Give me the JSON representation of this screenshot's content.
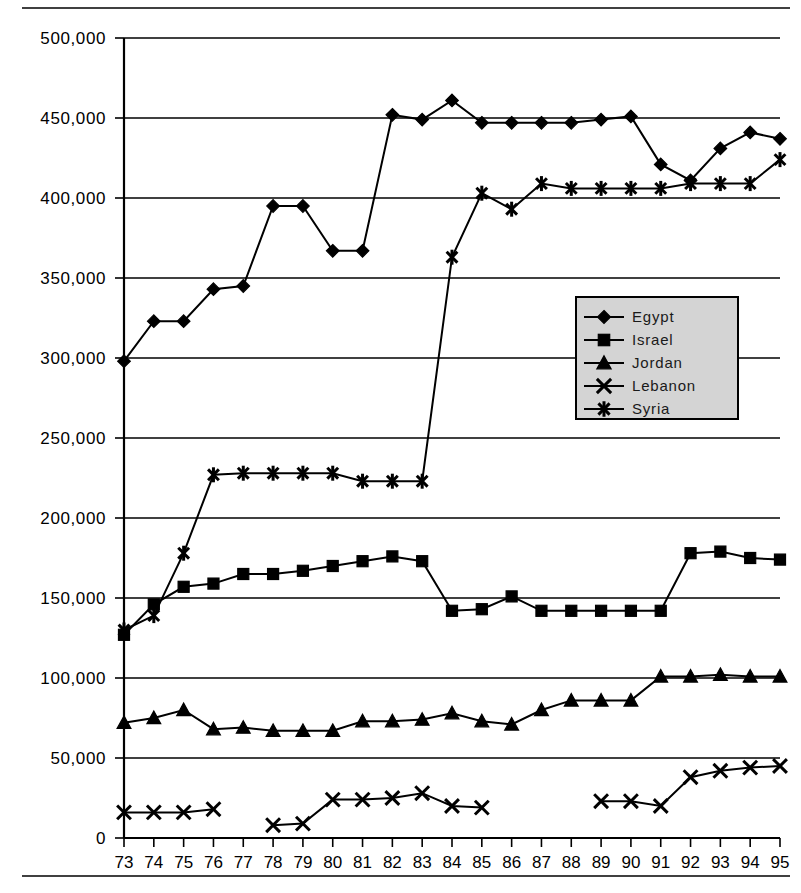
{
  "chart_data": {
    "type": "line",
    "title": "",
    "subtitle": "",
    "xlabel": "",
    "ylabel": "",
    "grid": "horizontal",
    "legend_position": "inside-right-upper",
    "xlim": [
      73,
      95
    ],
    "ylim": [
      0,
      500000
    ],
    "ytick_values": [
      0,
      50000,
      100000,
      150000,
      200000,
      250000,
      300000,
      350000,
      400000,
      450000,
      500000
    ],
    "ytick_labels": [
      "0",
      "50,000",
      "100,000",
      "150,000",
      "200,000",
      "250,000",
      "300,000",
      "350,000",
      "400,000",
      "450,000",
      "500,000"
    ],
    "categories": [
      "73",
      "74",
      "75",
      "76",
      "77",
      "78",
      "79",
      "80",
      "81",
      "82",
      "83",
      "84",
      "85",
      "86",
      "87",
      "88",
      "89",
      "90",
      "91",
      "92",
      "93",
      "94",
      "95"
    ],
    "series": [
      {
        "name": "Egypt",
        "marker": "diamond",
        "values": [
          298000,
          323000,
          323000,
          343000,
          345000,
          395000,
          395000,
          367000,
          367000,
          452000,
          449000,
          461000,
          447000,
          447000,
          447000,
          447000,
          449000,
          451000,
          421000,
          411000,
          431000,
          441000,
          437000
        ]
      },
      {
        "name": "Israel",
        "marker": "square",
        "values": [
          127000,
          146000,
          157000,
          159000,
          165000,
          165000,
          167000,
          170000,
          173000,
          176000,
          173000,
          142000,
          143000,
          151000,
          142000,
          142000,
          142000,
          142000,
          142000,
          178000,
          179000,
          175000,
          174000
        ]
      },
      {
        "name": "Jordan",
        "marker": "triangle",
        "values": [
          72000,
          75000,
          80000,
          68000,
          69000,
          67000,
          67000,
          67000,
          73000,
          73000,
          74000,
          78000,
          73000,
          71000,
          80000,
          86000,
          86000,
          86000,
          101000,
          101000,
          102000,
          101000,
          101000
        ]
      },
      {
        "name": "Lebanon",
        "marker": "x",
        "values": [
          16000,
          16000,
          16000,
          18000,
          null,
          8000,
          9000,
          24000,
          24000,
          25000,
          28000,
          20000,
          19000,
          null,
          null,
          null,
          23000,
          23000,
          20000,
          38000,
          42000,
          44000,
          45000
        ]
      },
      {
        "name": "Syria",
        "marker": "star",
        "values": [
          130000,
          139000,
          178000,
          227000,
          228000,
          228000,
          228000,
          228000,
          223000,
          223000,
          223000,
          363000,
          403000,
          393000,
          409000,
          406000,
          406000,
          406000,
          406000,
          409000,
          409000,
          409000,
          424000
        ]
      }
    ]
  },
  "legend": {
    "entries": [
      {
        "label": "Egypt"
      },
      {
        "label": "Israel"
      },
      {
        "label": "Jordan"
      },
      {
        "label": "Lebanon"
      },
      {
        "label": "Syria"
      }
    ]
  }
}
